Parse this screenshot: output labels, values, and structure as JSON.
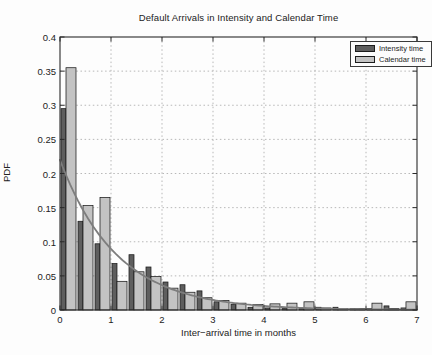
{
  "figure": {
    "title": "Default Arrivals in Intensity and Calendar Time",
    "xlabel": "Inter−arrival time in months",
    "ylabel": "PDF"
  },
  "legend": {
    "items": [
      {
        "label": "Intensity time",
        "color": "#5e5e5e"
      },
      {
        "label": "Calendar time",
        "color": "#c3c3c3"
      }
    ]
  },
  "chart_data": {
    "type": "bar",
    "title": "Default Arrivals in Intensity and Calendar Time",
    "xlabel": "Inter−arrival time in months",
    "ylabel": "PDF",
    "xlim": [
      0,
      7
    ],
    "ylim": [
      0,
      0.4
    ],
    "x_ticks": [
      0,
      1,
      2,
      3,
      4,
      5,
      6,
      7
    ],
    "x_tick_labels": [
      "0",
      "1",
      "2",
      "3",
      "4",
      "5",
      "6",
      "7"
    ],
    "y_ticks": [
      0,
      0.05,
      0.1,
      0.15,
      0.2,
      0.25,
      0.3,
      0.35,
      0.4
    ],
    "y_tick_labels": [
      "0",
      "0.05",
      "0.1",
      "0.15",
      "0.2",
      "0.25",
      "0.3",
      "0.35",
      "0.4"
    ],
    "grid": "dotted",
    "legend_position": "top-right",
    "bin_width": 0.3333,
    "bin_starts": [
      0,
      0.33,
      0.67,
      1.0,
      1.33,
      1.67,
      2.0,
      2.33,
      2.67,
      3.0,
      3.33,
      3.67,
      4.0,
      4.33,
      4.67,
      5.0,
      5.33,
      5.67,
      6.0,
      6.33,
      6.67
    ],
    "series": [
      {
        "name": "Intensity time",
        "color": "#5e5e5e",
        "values": [
          0.295,
          0.13,
          0.097,
          0.068,
          0.081,
          0.063,
          0.041,
          0.037,
          0.028,
          0.012,
          0.008,
          0.004,
          0.003,
          0.002,
          0.002,
          0.004,
          0.004,
          0.002,
          0.002,
          0.006,
          0.003
        ]
      },
      {
        "name": "Calendar time",
        "color": "#c3c3c3",
        "values": [
          0.355,
          0.153,
          0.165,
          0.042,
          0.056,
          0.049,
          0.032,
          0.026,
          0.018,
          0.014,
          0.01,
          0.008,
          0.009,
          0.01,
          0.012,
          0.003,
          0.002,
          0.002,
          0.01,
          0.002,
          0.012
        ]
      }
    ],
    "curve": {
      "name": "fitted exponential density",
      "formula": "0.22*exp(-0.9*t)",
      "a": 0.22,
      "lambda": 0.9,
      "color": "#7d7d7d"
    },
    "colors": {
      "axis": "#2a2a2a",
      "grid": "#b0b0b0",
      "bar_edge": "#1a1a1a",
      "plot_bg": "#fdfdfd"
    }
  }
}
